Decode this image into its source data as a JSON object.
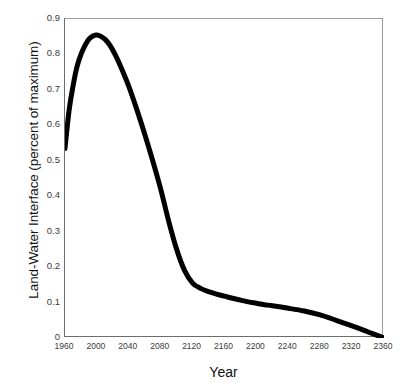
{
  "chart_data": {
    "type": "line",
    "title": "",
    "xlabel": "Year",
    "ylabel": "Land-Water Interface (percent of maximum)",
    "xlim": [
      1960,
      2360
    ],
    "ylim": [
      0,
      0.9
    ],
    "grid": false,
    "legend": false,
    "legend_position": "none",
    "line_color": "#000000",
    "line_width_px": 5,
    "x_ticks": [
      1960,
      2000,
      2040,
      2080,
      2120,
      2160,
      2200,
      2240,
      2280,
      2320,
      2360
    ],
    "x_tick_labels": [
      "1960",
      "2000",
      "2040",
      "2080",
      "2120",
      "2160",
      "2200",
      "2240",
      "2280",
      "2320",
      "2360"
    ],
    "y_ticks": [
      0,
      0.1,
      0.2,
      0.3,
      0.4,
      0.5,
      0.6,
      0.7,
      0.8,
      0.9
    ],
    "y_tick_labels": [
      "0",
      "0.1",
      "0.2",
      "0.3",
      "0.4",
      "0.5",
      "0.6",
      "0.7",
      "0.8",
      "0.9"
    ],
    "series": [
      {
        "name": "Land-Water Interface",
        "x": [
          1960,
          1965,
          1970,
          1975,
          1980,
          1985,
          1990,
          1995,
          2000,
          2005,
          2010,
          2015,
          2020,
          2025,
          2030,
          2040,
          2050,
          2060,
          2070,
          2080,
          2090,
          2100,
          2110,
          2120,
          2130,
          2140,
          2150,
          2160,
          2170,
          2180,
          2190,
          2200,
          2210,
          2220,
          2240,
          2260,
          2280,
          2300,
          2320,
          2340,
          2360
        ],
        "values": [
          0.535,
          0.64,
          0.71,
          0.765,
          0.8,
          0.825,
          0.843,
          0.852,
          0.855,
          0.851,
          0.843,
          0.83,
          0.812,
          0.79,
          0.765,
          0.71,
          0.645,
          0.575,
          0.5,
          0.42,
          0.33,
          0.25,
          0.19,
          0.155,
          0.14,
          0.131,
          0.124,
          0.118,
          0.112,
          0.107,
          0.102,
          0.098,
          0.094,
          0.091,
          0.084,
          0.076,
          0.065,
          0.05,
          0.034,
          0.017,
          0.0
        ]
      }
    ]
  },
  "axes": {
    "y_title": "Land-Water Interface (percent of maximum)",
    "x_title": "Year"
  }
}
